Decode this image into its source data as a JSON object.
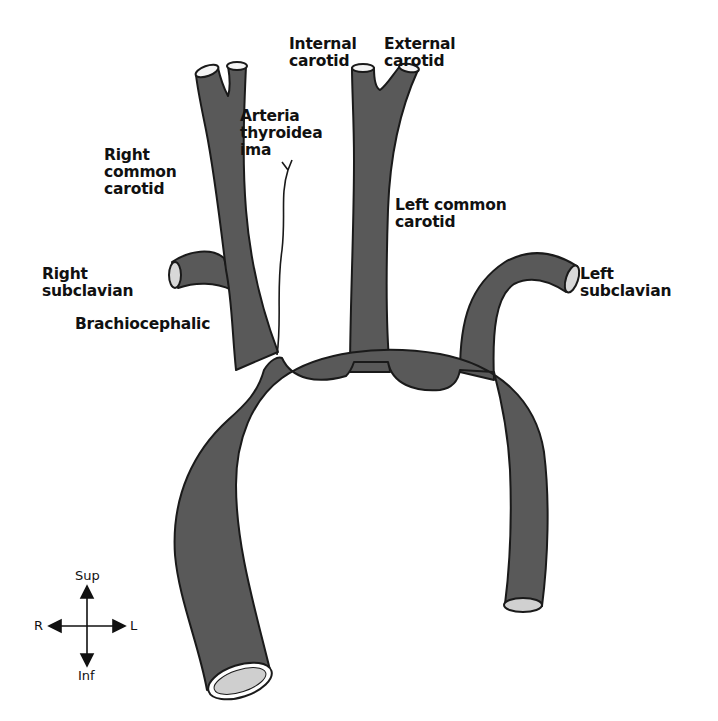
{
  "diagram": {
    "vessel_color": "#595959",
    "outline_color": "#1a1a1a",
    "lumen_color": "#cfcfcf",
    "labels": {
      "internal_carotid": "Internal\ncarotid",
      "external_carotid": "External\ncarotid",
      "arteria_thyroidea_ima": "Arteria\nthyroidea\nima",
      "right_common_carotid": "Right\ncommon\ncarotid",
      "left_common_carotid": "Left common\ncarotid",
      "right_subclavian": "Right\nsubclavian",
      "left_subclavian": "Left\nsubclavian",
      "brachiocephalic": "Brachiocephalic"
    },
    "compass": {
      "sup": "Sup",
      "inf": "Inf",
      "right": "R",
      "left": "L"
    }
  }
}
